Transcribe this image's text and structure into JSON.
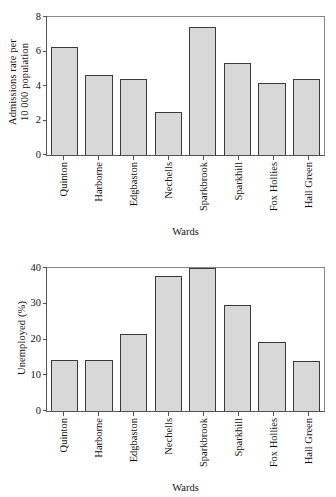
{
  "figure": {
    "background": "#ffffff",
    "bar_fill": "#d8d8d8",
    "bar_edge": "#3a3a3a",
    "axis_color": "#555555"
  },
  "chart_data": [
    {
      "type": "bar",
      "title": "",
      "xlabel": "Wards",
      "ylabel": "Admissions rate per\n10 000 population",
      "ylabel_line1": "Admissions rate per",
      "ylabel_line2": "10 000 population",
      "categories": [
        "Quinton",
        "Harborne",
        "Edgbaston",
        "Nechells",
        "Sparkbrook",
        "Sparkhill",
        "Fox Hollies",
        "Hall Green"
      ],
      "values": [
        6.25,
        4.65,
        4.4,
        2.5,
        7.4,
        5.35,
        4.2,
        4.4
      ],
      "ylim": [
        0,
        8
      ],
      "yticks": [
        0,
        2,
        4,
        6,
        8
      ],
      "ytick_labels": [
        "0",
        "2",
        "4",
        "6",
        "8"
      ],
      "grid": false,
      "legend": "none"
    },
    {
      "type": "bar",
      "title": "",
      "xlabel": "Wards",
      "ylabel": "Unemployed (%)",
      "categories": [
        "Quinton",
        "Harborne",
        "Edgbaston",
        "Nechells",
        "Sparkbrook",
        "Sparkhill",
        "Fox Hollies",
        "Hall Green"
      ],
      "values": [
        14.3,
        14.3,
        21.6,
        37.9,
        40.0,
        29.6,
        19.4,
        14.0
      ],
      "ylim": [
        0,
        40
      ],
      "yticks": [
        0,
        10,
        20,
        30,
        40
      ],
      "ytick_labels": [
        "0",
        "10",
        "20",
        "30",
        "40"
      ],
      "grid": false,
      "legend": "none"
    }
  ]
}
